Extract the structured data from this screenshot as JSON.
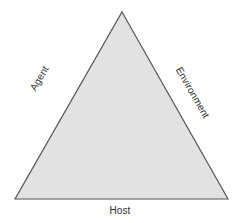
{
  "diagram": {
    "type": "triangle-diagram",
    "background_color": "#ffffff",
    "shape": {
      "name": "triangle",
      "fill_color": "#e2e2e2",
      "stroke_color": "#555555",
      "stroke_width": 1.2,
      "points": "122,12 228,199 15,199"
    },
    "labels": {
      "left_edge": "Agent",
      "right_edge": "Environment",
      "bottom_edge": "Host"
    },
    "text_color": "#2e2e2e"
  }
}
